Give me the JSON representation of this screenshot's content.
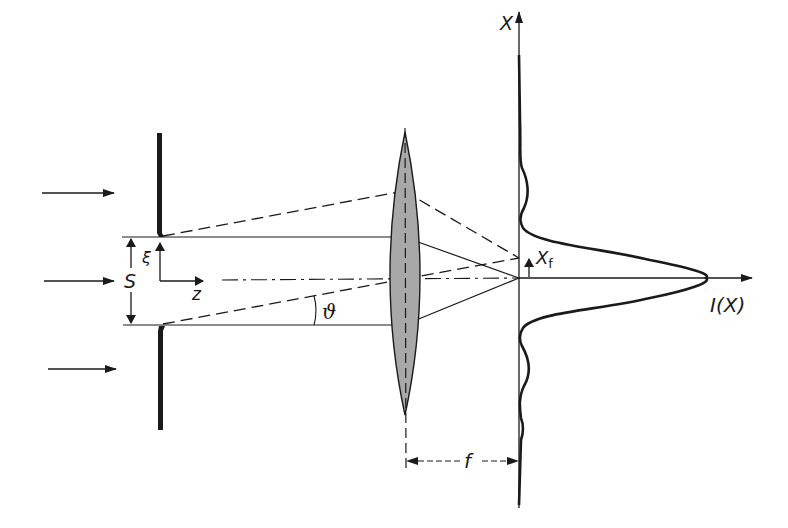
{
  "figure": {
    "type": "single-slit Fraunhofer diffraction with converging lens",
    "colors": {
      "ink": "#1a1a1a",
      "lens_fill": "#a8a8a8",
      "background": "#ffffff"
    }
  },
  "labels": {
    "slit_width": "S",
    "slit_coordinate": "ξ",
    "optical_axis": "z",
    "diffraction_angle": "ϑ",
    "screen_axis": "X",
    "focus_offset": "X",
    "focus_offset_sub": "f",
    "intensity": "I(X)",
    "focal_length": "f"
  },
  "elements": {
    "incident_arrows": 3,
    "slit": "aperture plate with opening of width S",
    "lens": "biconvex converging lens (shaded)",
    "screen": "observation plane at focal distance f",
    "intensity_profile": "central maximum with weaker side lobes"
  }
}
